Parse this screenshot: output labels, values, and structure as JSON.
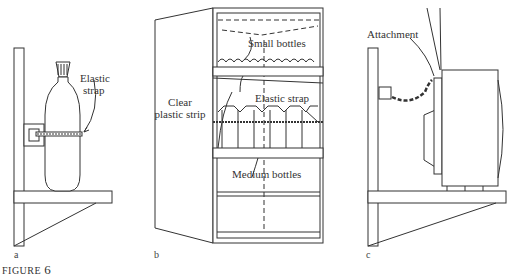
{
  "figure": {
    "label": "FIGURE",
    "number": "6"
  },
  "panels": [
    {
      "letter": "a",
      "labels": [
        "Elastic",
        "strap"
      ]
    },
    {
      "letter": "b",
      "labels": {
        "small_bottles": "Small bottles",
        "clear_strip_1": "Clear",
        "clear_strip_2": "plastic strip",
        "elastic_strap": "Elastic strap",
        "medium_bottles": "Medium bottles"
      }
    },
    {
      "letter": "c",
      "labels": {
        "attachment": "Attachment"
      }
    }
  ]
}
